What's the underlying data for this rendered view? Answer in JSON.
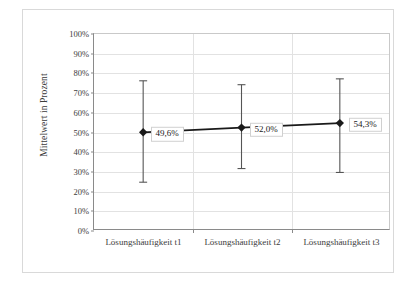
{
  "chart_data": {
    "type": "line",
    "title": "",
    "xlabel": "",
    "ylabel": "Mittelwert in Prozent",
    "categories": [
      "Lösungshäufigkeit t1",
      "Lösungshäufigkeit t2",
      "Lösungshäufigkeit t3"
    ],
    "values": [
      49.6,
      52.0,
      54.3
    ],
    "data_labels": [
      "49,6%",
      "52,0%",
      "54,3%"
    ],
    "error_bars": {
      "upper": [
        76.0,
        74.0,
        77.0
      ],
      "lower": [
        24.0,
        31.0,
        29.0
      ]
    },
    "ylim": [
      0,
      100
    ],
    "ytick_values": [
      0,
      10,
      20,
      30,
      40,
      50,
      60,
      70,
      80,
      90,
      100
    ],
    "ytick_labels": [
      "0%",
      "10%",
      "20%",
      "30%",
      "40%",
      "50%",
      "60%",
      "70%",
      "80%",
      "90%",
      "100%"
    ],
    "grid": true,
    "legend": "none",
    "marker": "diamond",
    "series_color": "#1a1a1a",
    "gridline_color": "#e2e2e2",
    "axis_color": "#8a8a8a",
    "frame_color": "#d9d9d9"
  }
}
